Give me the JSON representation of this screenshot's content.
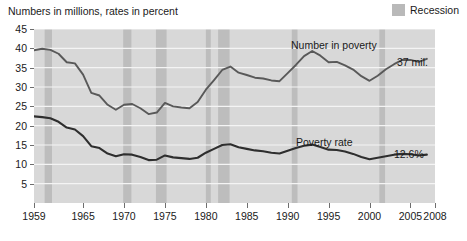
{
  "caption": "Numbers in millions, rates in percent",
  "legend": {
    "items": [
      {
        "label": "Recession",
        "color": "#bdbdbd",
        "icon": "recession-swatch"
      }
    ]
  },
  "annotations": {
    "number_series_label": "Number in poverty",
    "number_end_value": "37 mil.",
    "rate_series_label": "Poverty rate",
    "rate_end_value": "12.6%"
  },
  "axis": {
    "y_ticks": [
      "5",
      "10",
      "15",
      "20",
      "25",
      "30",
      "35",
      "40",
      "45"
    ],
    "x_ticks": [
      "1959",
      "1965",
      "1970",
      "1975",
      "1980",
      "1985",
      "1990",
      "1995",
      "2000",
      "2005",
      "2008"
    ]
  },
  "chart_data": {
    "type": "line",
    "title": "",
    "subtitle": "Numbers in millions, rates in percent",
    "xlabel": "",
    "ylabel": "",
    "xlim": [
      1959,
      2008
    ],
    "ylim": [
      0,
      45
    ],
    "grid": true,
    "legend_position": "top-right",
    "x": [
      1959,
      1960,
      1961,
      1962,
      1963,
      1964,
      1965,
      1966,
      1967,
      1968,
      1969,
      1970,
      1971,
      1972,
      1973,
      1974,
      1975,
      1976,
      1977,
      1978,
      1979,
      1980,
      1981,
      1982,
      1983,
      1984,
      1985,
      1986,
      1987,
      1988,
      1989,
      1990,
      1991,
      1992,
      1993,
      1994,
      1995,
      1996,
      1997,
      1998,
      1999,
      2000,
      2001,
      2002,
      2003,
      2004,
      2005,
      2006,
      2007
    ],
    "series": [
      {
        "name": "Number in poverty",
        "unit": "millions",
        "color": "#595959",
        "end_label": "37 mil.",
        "values": [
          39.5,
          39.9,
          39.6,
          38.6,
          36.4,
          36.1,
          33.2,
          28.5,
          27.8,
          25.4,
          24.1,
          25.4,
          25.6,
          24.5,
          23.0,
          23.4,
          25.9,
          25.0,
          24.7,
          24.5,
          26.1,
          29.3,
          31.8,
          34.4,
          35.3,
          33.7,
          33.1,
          32.4,
          32.2,
          31.7,
          31.5,
          33.6,
          35.7,
          38.0,
          39.3,
          38.1,
          36.4,
          36.5,
          35.6,
          34.5,
          32.8,
          31.6,
          32.9,
          34.6,
          35.9,
          37.0,
          37.0,
          36.5,
          37.3
        ]
      },
      {
        "name": "Poverty rate",
        "unit": "percent",
        "color": "#333333",
        "end_label": "12.6%",
        "values": [
          22.4,
          22.2,
          21.9,
          21.0,
          19.5,
          19.0,
          17.3,
          14.7,
          14.2,
          12.8,
          12.1,
          12.6,
          12.5,
          11.9,
          11.1,
          11.2,
          12.3,
          11.8,
          11.6,
          11.4,
          11.7,
          13.0,
          14.0,
          15.0,
          15.2,
          14.4,
          14.0,
          13.6,
          13.4,
          13.0,
          12.8,
          13.5,
          14.2,
          14.8,
          15.1,
          14.5,
          13.8,
          13.7,
          13.3,
          12.7,
          11.9,
          11.3,
          11.7,
          12.1,
          12.5,
          12.7,
          12.6,
          12.3,
          12.5
        ]
      }
    ],
    "recession_bands": [
      {
        "start": 1960.3,
        "end": 1961.2
      },
      {
        "start": 1969.9,
        "end": 1970.9
      },
      {
        "start": 1973.9,
        "end": 1975.2
      },
      {
        "start": 1980.0,
        "end": 1980.6
      },
      {
        "start": 1981.5,
        "end": 1982.9
      },
      {
        "start": 1990.5,
        "end": 1991.2
      },
      {
        "start": 2001.2,
        "end": 2001.9
      }
    ]
  }
}
